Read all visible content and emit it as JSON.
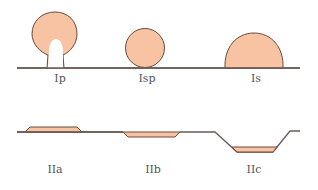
{
  "diagram": {
    "colors": {
      "fill": "#F7C3A3",
      "stroke": "#6B4A3A",
      "line": "#6B5A55",
      "label": "#555555"
    },
    "types": [
      {
        "id": "Ip",
        "label": "Ip",
        "shape": "pedunculated"
      },
      {
        "id": "Isp",
        "label": "Isp",
        "shape": "subpedunculated"
      },
      {
        "id": "Is",
        "label": "Is",
        "shape": "sessile"
      },
      {
        "id": "IIa",
        "label": "IIa",
        "shape": "superficial-elevated"
      },
      {
        "id": "IIb",
        "label": "IIb",
        "shape": "flat"
      },
      {
        "id": "IIc",
        "label": "IIc",
        "shape": "depressed"
      }
    ]
  }
}
